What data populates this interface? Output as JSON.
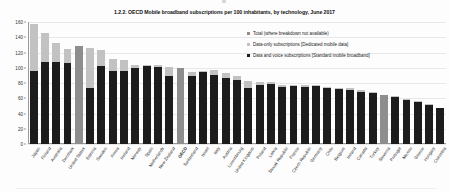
{
  "figure": {
    "title": "1.2.2. OECD Mobile broadband subscriptions per 100 inhabitants, by technology, June 2017"
  },
  "legend": {
    "position": "top-right",
    "items": [
      {
        "name": "total",
        "label": "Total (where breakdown not available)",
        "color": "#8e8e8e"
      },
      {
        "name": "data-only",
        "label": "Data-only subscriptions [Dedicated mobile data]",
        "color": "#c2c2c2"
      },
      {
        "name": "data-voice",
        "label": "Data and voice subscriptions [Standard mobile broadband]",
        "color": "#1c1c1c"
      }
    ]
  },
  "chart_data": {
    "type": "bar",
    "subtype": "stacked-vertical",
    "title": "1.2.2. OECD Mobile broadband subscriptions per 100 inhabitants, by technology, June 2017",
    "xlabel": "",
    "ylabel": "",
    "ylim": [
      0,
      160
    ],
    "yticks": [
      0,
      20,
      40,
      60,
      80,
      100,
      120,
      140,
      160
    ],
    "grid": true,
    "categories": [
      "Japan",
      "Finland",
      "Australia",
      "Denmark",
      "United States",
      "Estonia",
      "Sweden",
      "Korea",
      "Iceland",
      "Norway",
      "Spain",
      "Netherlands",
      "New Zealand",
      "OECD",
      "Switzerland",
      "Israel",
      "Italy",
      "Austria",
      "Luxembourg",
      "United Kingdom",
      "Poland",
      "Latvia",
      "Slovak Republic",
      "France",
      "Czech Republic",
      "Germany",
      "Chile",
      "Belgium",
      "Ireland",
      "Canada",
      "Turkey",
      "Slovenia",
      "Portugal",
      "Mexico",
      "Greece",
      "Hungary",
      "Colombia"
    ],
    "series": [
      {
        "name": "Data and voice subscriptions [Standard mobile broadband]",
        "color": "#1c1c1c",
        "values": [
          96,
          108,
          108,
          106,
          null,
          73,
          102,
          96,
          96,
          100,
          102,
          101,
          89,
          null,
          89,
          95,
          90,
          87,
          84,
          73,
          77,
          79,
          75,
          76,
          75,
          77,
          74,
          72,
          71,
          68,
          67,
          null,
          62,
          58,
          55,
          52,
          47
        ]
      },
      {
        "name": "Data-only subscriptions [Dedicated mobile data]",
        "color": "#c2c2c2",
        "values": [
          62,
          38,
          24,
          19,
          null,
          53,
          21,
          15,
          14,
          3,
          1,
          2,
          12,
          null,
          6,
          1,
          7,
          6,
          5,
          10,
          4,
          2,
          3,
          2,
          2,
          1,
          1,
          2,
          2,
          3,
          1,
          null,
          1,
          1,
          1,
          1,
          0
        ]
      },
      {
        "name": "Total (where breakdown not available)",
        "color": "#8e8e8e",
        "values": [
          null,
          null,
          null,
          null,
          128,
          null,
          null,
          null,
          null,
          null,
          null,
          null,
          null,
          100,
          null,
          null,
          null,
          null,
          null,
          null,
          null,
          null,
          null,
          null,
          null,
          null,
          null,
          null,
          null,
          null,
          null,
          64,
          null,
          null,
          null,
          null,
          null
        ]
      }
    ],
    "totals": [
      158,
      146,
      132,
      125,
      128,
      126,
      123,
      111,
      110,
      103,
      103,
      103,
      101,
      100,
      95,
      96,
      97,
      93,
      89,
      83,
      81,
      81,
      78,
      78,
      77,
      78,
      75,
      74,
      73,
      71,
      68,
      64,
      63,
      59,
      56,
      53,
      47
    ],
    "highlight_category": "OECD"
  }
}
